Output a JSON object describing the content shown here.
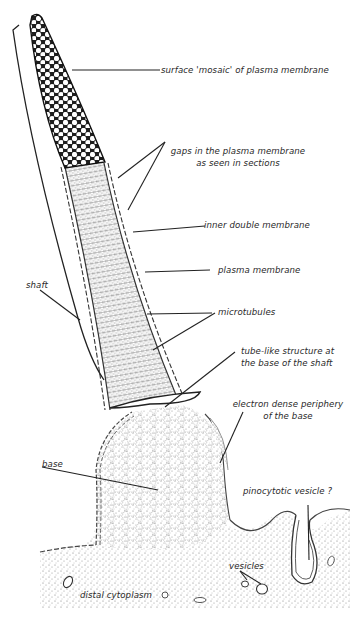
{
  "figure": {
    "type": "biological illustration"
  },
  "labels": {
    "surface_mosaic": "surface 'mosaic' of plasma membrane",
    "gaps_line1": "gaps in the plasma membrane",
    "gaps_line2": "as seen in sections",
    "inner_double_membrane": "inner double membrane",
    "plasma_membrane": "plasma membrane",
    "microtubules": "microtubules",
    "shaft": "shaft",
    "tube_line1": "tube-like structure at",
    "tube_line2": "the base of the shaft",
    "electron_line1": "electron dense periphery",
    "electron_line2": "of the base",
    "base": "base",
    "pinocytotic": "pinocytotic vesicle ?",
    "vesicles": "vesicles",
    "distal_cytoplasm": "distal cytoplasm"
  },
  "colors": {
    "ink": "#222222",
    "stipple": "#9a9a9a",
    "background": "#ffffff"
  }
}
